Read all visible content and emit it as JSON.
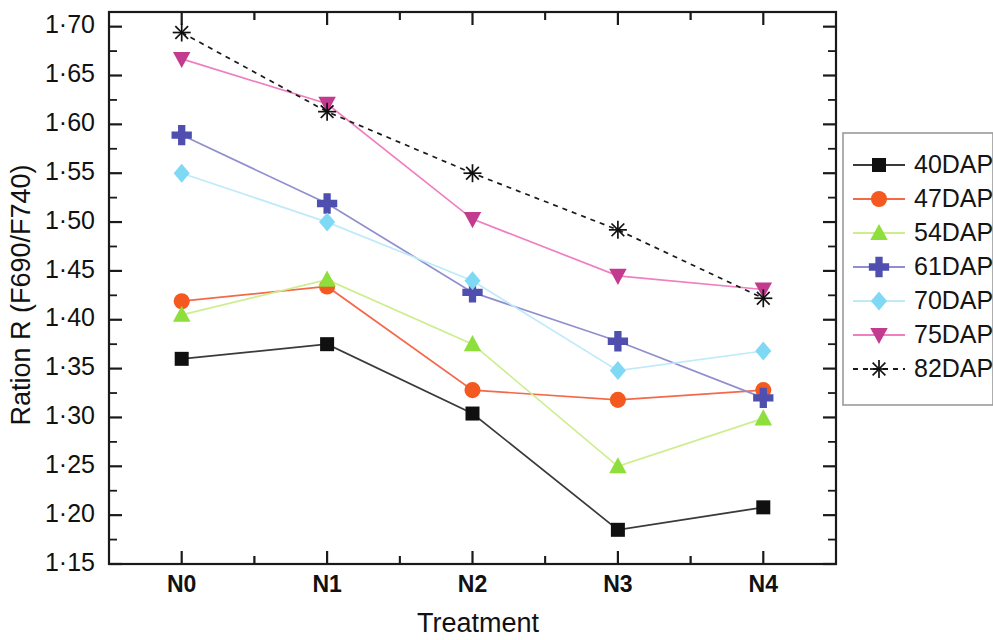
{
  "chart_data": {
    "type": "line",
    "title": "",
    "xlabel": "Treatment",
    "ylabel": "Ration R (F690/F740)",
    "categories": [
      "N0",
      "N1",
      "N2",
      "N3",
      "N4"
    ],
    "ylim": [
      1.15,
      1.715
    ],
    "ytick_labels": [
      "1·15",
      "1·20",
      "1·25",
      "1·30",
      "1·35",
      "1·40",
      "1·45",
      "1·50",
      "1·55",
      "1·60",
      "1·65",
      "1·70"
    ],
    "ytick_values": [
      1.15,
      1.2,
      1.25,
      1.3,
      1.35,
      1.4,
      1.45,
      1.5,
      1.55,
      1.6,
      1.65,
      1.7
    ],
    "minor_ticks": true,
    "grid": false,
    "legend_position": "right",
    "series": [
      {
        "name": "40DAP",
        "color": "#101010",
        "line_color": "#3a3a3a",
        "marker": "square",
        "dash": "none",
        "values": [
          1.36,
          1.375,
          1.304,
          1.185,
          1.208
        ]
      },
      {
        "name": "47DAP",
        "color": "#f4591f",
        "line_color": "#f4694a",
        "marker": "circle",
        "dash": "none",
        "values": [
          1.419,
          1.434,
          1.328,
          1.318,
          1.328
        ]
      },
      {
        "name": "54DAP",
        "color": "#8ede3c",
        "line_color": "#cdee8e",
        "marker": "triangle-up",
        "dash": "none",
        "values": [
          1.405,
          1.441,
          1.375,
          1.25,
          1.299
        ]
      },
      {
        "name": "61DAP",
        "color": "#4f4fb0",
        "line_color": "#8f8fd0",
        "marker": "plus",
        "dash": "none",
        "values": [
          1.589,
          1.519,
          1.428,
          1.378,
          1.32
        ]
      },
      {
        "name": "70DAP",
        "color": "#7fd9f5",
        "line_color": "#bfeaf9",
        "marker": "diamond",
        "dash": "none",
        "values": [
          1.55,
          1.5,
          1.44,
          1.348,
          1.368
        ]
      },
      {
        "name": "75DAP",
        "color": "#c23b8f",
        "line_color": "#ef7fc0",
        "marker": "triangle-down",
        "dash": "none",
        "values": [
          1.667,
          1.621,
          1.503,
          1.445,
          1.431
        ]
      },
      {
        "name": "82DAP",
        "color": "#101010",
        "line_color": "#1a1a1a",
        "marker": "asterisk",
        "dash": "dashed",
        "values": [
          1.694,
          1.613,
          1.55,
          1.492,
          1.422
        ]
      }
    ]
  },
  "legend": {
    "entries": [
      "40DAP",
      "47DAP",
      "54DAP",
      "61DAP",
      "70DAP",
      "75DAP",
      "82DAP"
    ]
  }
}
